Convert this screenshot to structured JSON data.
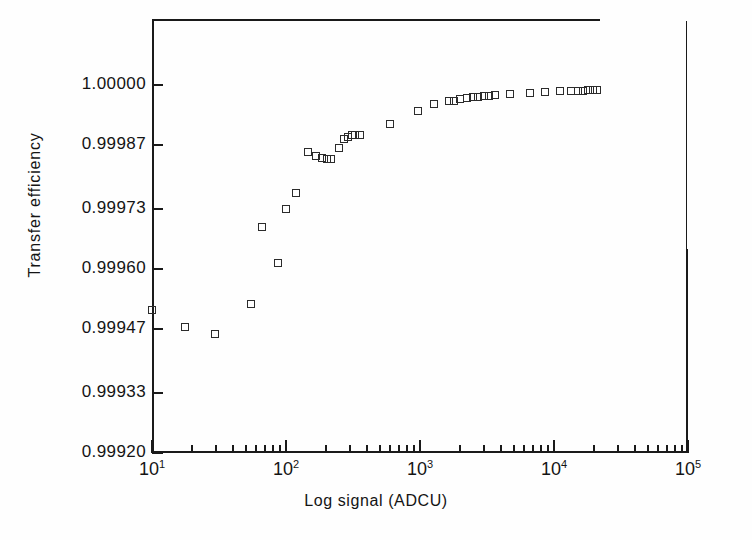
{
  "figure": {
    "y_axis_title": "Transfer efficiency",
    "x_axis_title": "Log signal (ADCU)"
  },
  "axes": {
    "y_tick_labels": [
      "1.00000",
      "0.99987",
      "0.99973",
      "0.99960",
      "0.99947",
      "0.99933",
      "0.99920"
    ],
    "x_tick_labels": [
      "10",
      "10",
      "10",
      "10",
      "10"
    ],
    "x_tick_exponents": [
      "1",
      "2",
      "3",
      "4",
      "5"
    ]
  },
  "chart_data": {
    "type": "scatter",
    "title": "",
    "xlabel": "Log signal (ADCU)",
    "ylabel": "Transfer efficiency",
    "xscale": "log",
    "xlim": [
      10,
      100000
    ],
    "ylim": [
      0.9992,
      1.0
    ],
    "yticks": [
      0.9992,
      0.99933,
      0.99947,
      0.9996,
      0.99973,
      0.99987,
      1.0
    ],
    "xticks": [
      10,
      100,
      1000,
      10000,
      100000
    ],
    "grid": false,
    "legend": null,
    "marker": "open-square",
    "series": [
      {
        "name": "Transfer efficiency",
        "points": [
          [
            10.0,
            0.999511
          ],
          [
            17.5,
            0.999475
          ],
          [
            29.5,
            0.999459
          ],
          [
            55.0,
            0.999523
          ],
          [
            66.0,
            0.999691
          ],
          [
            87.0,
            0.999613
          ],
          [
            100.0,
            0.99973
          ],
          [
            118.0,
            0.999766
          ],
          [
            147.0,
            0.999854
          ],
          [
            168.0,
            0.999845
          ],
          [
            185.0,
            0.999842
          ],
          [
            204.0,
            0.99984
          ],
          [
            218.0,
            0.99984
          ],
          [
            250.0,
            0.999862
          ],
          [
            272.0,
            0.999882
          ],
          [
            290.0,
            0.999886
          ],
          [
            310.0,
            0.999891
          ],
          [
            330.0,
            0.999891
          ],
          [
            355.0,
            0.999891
          ],
          [
            600.0,
            0.999916
          ],
          [
            960.0,
            0.999944
          ],
          [
            1280.0,
            0.999958
          ],
          [
            1650.0,
            0.999966
          ],
          [
            1800.0,
            0.999966
          ],
          [
            2000.0,
            0.99997
          ],
          [
            2250.0,
            0.999972
          ],
          [
            2500.0,
            0.999974
          ],
          [
            2700.0,
            0.999974
          ],
          [
            3000.0,
            0.999976
          ],
          [
            3250.0,
            0.999976
          ],
          [
            3600.0,
            0.999978
          ],
          [
            4700.0,
            0.99998
          ],
          [
            6600.0,
            0.999982
          ],
          [
            8500.0,
            0.999984
          ],
          [
            11000.0,
            0.999986
          ],
          [
            13500.0,
            0.999988
          ],
          [
            15000.0,
            0.999988
          ],
          [
            16500.0,
            0.999988
          ],
          [
            18000.0,
            0.999989
          ],
          [
            19500.0,
            0.999989
          ],
          [
            21000.0,
            0.999989
          ]
        ]
      }
    ]
  }
}
